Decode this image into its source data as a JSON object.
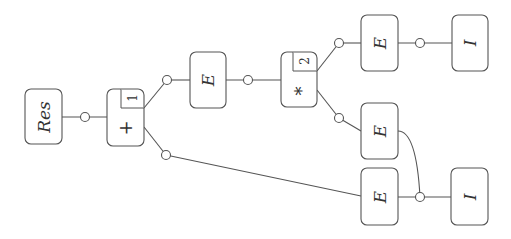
{
  "diagram": {
    "type": "expression-tree",
    "orientation": "rotated-90-ccw",
    "colors": {
      "stroke": "#555555",
      "text": "#333333",
      "background": "#ffffff"
    },
    "nodes": [
      {
        "id": "res",
        "label": "Res",
        "kind": "root"
      },
      {
        "id": "plus",
        "label": "+",
        "index": "1",
        "kind": "operator"
      },
      {
        "id": "e1",
        "label": "E",
        "kind": "expression"
      },
      {
        "id": "star",
        "label": "*",
        "index": "2",
        "kind": "operator"
      },
      {
        "id": "e2",
        "label": "E",
        "kind": "expression"
      },
      {
        "id": "i1",
        "label": "I",
        "kind": "identifier"
      },
      {
        "id": "e3",
        "label": "E",
        "kind": "expression"
      },
      {
        "id": "e4",
        "label": "E",
        "kind": "expression"
      },
      {
        "id": "i2",
        "label": "I",
        "kind": "identifier"
      }
    ],
    "edges": [
      {
        "from": "res",
        "to": "plus"
      },
      {
        "from": "plus",
        "to": "e1"
      },
      {
        "from": "plus",
        "to": "e4"
      },
      {
        "from": "e1",
        "to": "star"
      },
      {
        "from": "star",
        "to": "e2"
      },
      {
        "from": "star",
        "to": "e3"
      },
      {
        "from": "e2",
        "to": "i1"
      },
      {
        "from": "e4",
        "to": "i2"
      },
      {
        "from": "e3",
        "to": "i2",
        "note": "shared subterm (curved edge)"
      }
    ]
  },
  "labels": {
    "res": "Res",
    "plus": "+",
    "plus_index": "1",
    "e1": "E",
    "star": "*",
    "star_index": "2",
    "e2": "E",
    "i1": "I",
    "e3": "E",
    "e4": "E",
    "i2": "I"
  }
}
